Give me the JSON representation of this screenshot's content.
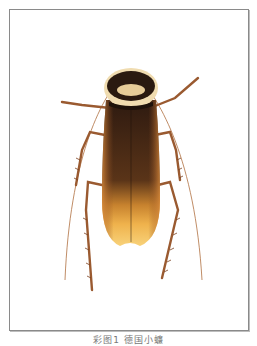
{
  "figure": {
    "caption": "彩图1 德国小蠊",
    "colors": {
      "frame": "#8a8a8a",
      "pronotum_dark": "#2a1a10",
      "pronotum_light": "#f0dcb0",
      "wings_dark": "#3d2214",
      "wings_amber": "#e9a640",
      "wing_tip": "#f6c86a",
      "legs": "#9a5a30"
    }
  }
}
